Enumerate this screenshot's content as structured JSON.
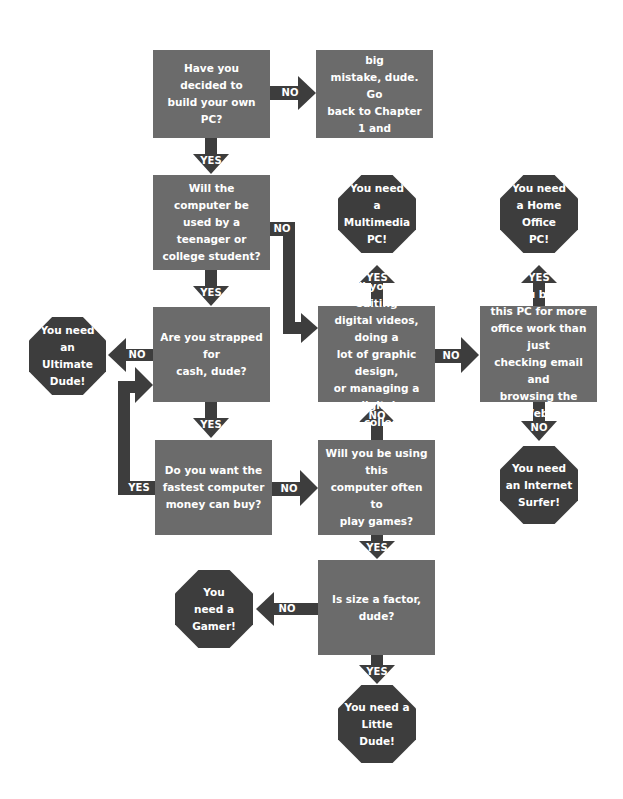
{
  "colors": {
    "question_box": "#6b6b6b",
    "result_octagon": "#3d3d3d",
    "arrow": "#3d3d3d",
    "text": "#ffffff"
  },
  "questions": {
    "q1": "Have you decided to\nbuild your own PC?",
    "mistake": "You're making a big\nmistake, dude. Go\nback to Chapter 1 and\nread it again.",
    "q2": "Will the computer be\nused by a teenager or\ncollege student?",
    "q3": "Are you strapped for\ncash, dude?",
    "q4": "Do you want the\nfastest computer\nmoney can buy?",
    "q5": "Will you be editing\ndigital videos, doing a\nlot of graphic design,\nor managing a digital\nmusic collection?",
    "q6": "Will you be using\nthis PC for more\noffice work than just\nchecking email and\nbrowsing the Web?",
    "q7": "Will you be using this\ncomputer often to\nplay games?",
    "q8": "Is size a factor, dude?"
  },
  "results": {
    "ultimate": "You need\nan Ultimate\nDude!",
    "multimedia": "You need\na Multimedia\nPC!",
    "home_office": "You need\na Home Office\nPC!",
    "internet_surfer": "You need\nan Internet\nSurfer!",
    "gamer": "You\nneed a\nGamer!",
    "little_dude": "You need a\nLittle Dude!"
  },
  "labels": {
    "yes": "YES",
    "no": "NO"
  }
}
